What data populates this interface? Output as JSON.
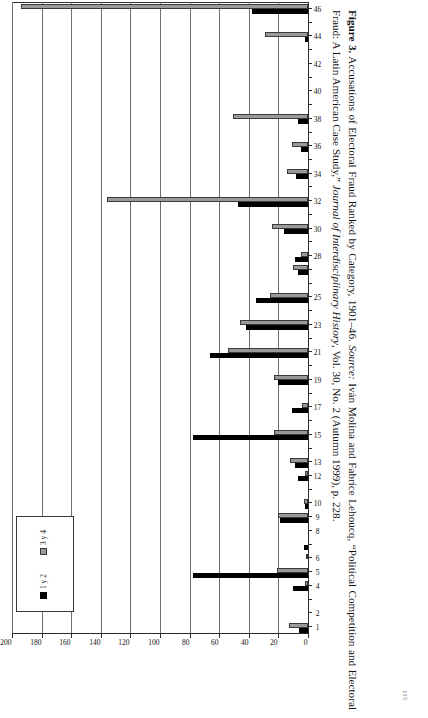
{
  "figure": {
    "label": "Figure 3.",
    "title_text": "Accusations of Electoral Fraud Ranked by Category, 1901–46.",
    "source_label": "Source:",
    "source_authors": "Iván Molina and Fabrice Lehoucq,",
    "source_article": "“Political Competition and Electoral Fraud: A Latin American Case Study,”",
    "source_journal": "Journal of Interdisciplinary History",
    "source_volume": ", Vol. 30, No. 2 (Autumn 1999), p. 228.",
    "folio": "115"
  },
  "legend": {
    "position": "inside-plot-lower-left",
    "entries": [
      {
        "label": "1 y 2",
        "color": "#000000",
        "icon": "square-swatch-black"
      },
      {
        "label": "3 y 4",
        "color": "#9a9a9a",
        "icon": "square-swatch-gray"
      }
    ]
  },
  "chart_data": {
    "type": "bar",
    "orientation": "vertical-rendered-rotated",
    "title": "Accusations of Electoral Fraud Ranked by Category, 1901–46",
    "xlabel": "",
    "ylabel": "",
    "ylim": [
      0,
      200
    ],
    "grid": true,
    "y_ticks": [
      0,
      20,
      40,
      60,
      80,
      100,
      120,
      140,
      160,
      180,
      200
    ],
    "y_tick_labels": [
      "0",
      "20",
      "40",
      "60",
      "80",
      "100",
      "120",
      "140",
      "160",
      "180",
      "200"
    ],
    "categories": [
      "1",
      "2",
      "3",
      "4",
      "5",
      "6",
      "7",
      "8",
      "9",
      "10",
      "11",
      "12",
      "13",
      "14",
      "15",
      "16",
      "17",
      "18",
      "19",
      "20",
      "21",
      "22",
      "23",
      "24",
      "25",
      "26",
      "27",
      "28",
      "29",
      "30",
      "31",
      "32",
      "33",
      "34",
      "35",
      "36",
      "37",
      "38",
      "39",
      "40",
      "41",
      "42",
      "43",
      "44",
      "45",
      "46"
    ],
    "x_tick_labels_shown": [
      "1",
      "2",
      "4",
      "5",
      "6",
      "8",
      "9",
      "10",
      "12",
      "13",
      "15",
      "17",
      "19",
      "21",
      "23",
      "25",
      "28",
      "30",
      "32",
      "34",
      "36",
      "38",
      "40",
      "42",
      "44",
      "46"
    ],
    "series": [
      {
        "name": "1 y 2",
        "color": "#000000",
        "values": [
          6,
          0,
          0,
          10,
          78,
          0,
          3,
          0,
          19,
          2,
          0,
          7,
          9,
          0,
          78,
          0,
          11,
          0,
          20,
          0,
          66,
          0,
          42,
          0,
          35,
          0,
          7,
          9,
          0,
          16,
          0,
          47,
          0,
          8,
          0,
          5,
          0,
          7,
          0,
          0,
          0,
          0,
          0,
          2,
          0,
          38
        ]
      },
      {
        "name": "3 y 4",
        "color": "#9a9a9a",
        "values": [
          13,
          0,
          0,
          2,
          21,
          1,
          0,
          0,
          20,
          3,
          0,
          2,
          12,
          0,
          23,
          0,
          4,
          0,
          23,
          0,
          54,
          0,
          46,
          0,
          26,
          0,
          10,
          5,
          0,
          24,
          0,
          136,
          0,
          14,
          0,
          11,
          0,
          51,
          0,
          0,
          0,
          0,
          0,
          29,
          0,
          194
        ]
      }
    ]
  }
}
